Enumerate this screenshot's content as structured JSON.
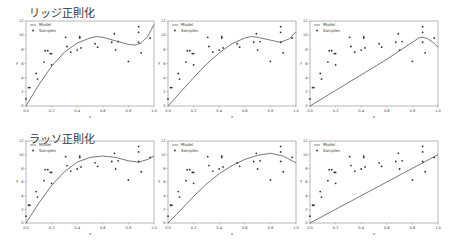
{
  "rows": [
    {
      "title": "リッジ正則化",
      "title_x": 29,
      "title_y": 5
    },
    {
      "title": "ラッソ正則化",
      "title_x": 29,
      "title_y": 131
    }
  ],
  "chart_data": [
    {
      "type": "line",
      "row": 0,
      "col": 0,
      "title": "",
      "xlabel": "x",
      "ylabel": "y",
      "xlim": [
        0,
        1
      ],
      "ylim": [
        0,
        12
      ],
      "legend": [
        "Model",
        "Samples"
      ],
      "model": {
        "x": [
          0,
          0.1,
          0.2,
          0.3,
          0.4,
          0.5,
          0.55,
          0.6,
          0.7,
          0.8,
          0.85,
          0.9,
          0.95,
          1.0
        ],
        "y": [
          0,
          3.0,
          5.6,
          7.6,
          8.9,
          9.6,
          9.8,
          9.7,
          9.2,
          8.7,
          8.6,
          8.9,
          9.8,
          11.5
        ]
      }
    },
    {
      "type": "line",
      "row": 0,
      "col": 1,
      "title": "",
      "xlabel": "x",
      "ylabel": "y",
      "xlim": [
        0,
        1
      ],
      "ylim": [
        0,
        12
      ],
      "legend": [
        "Model",
        "Samples"
      ],
      "model": {
        "x": [
          0,
          0.1,
          0.2,
          0.3,
          0.4,
          0.5,
          0.6,
          0.65,
          0.7,
          0.8,
          0.88,
          0.95,
          1.0
        ],
        "y": [
          0,
          2.0,
          4.0,
          5.9,
          7.5,
          8.8,
          9.6,
          9.8,
          9.7,
          9.3,
          9.0,
          9.5,
          10.5
        ]
      }
    },
    {
      "type": "line",
      "row": 0,
      "col": 2,
      "title": "",
      "xlabel": "x",
      "ylabel": "y",
      "xlim": [
        0,
        1
      ],
      "ylim": [
        0,
        12
      ],
      "legend": [
        "Model",
        "Samples"
      ],
      "model": {
        "x": [
          0,
          0.2,
          0.4,
          0.6,
          0.7,
          0.8,
          0.85,
          0.88,
          0.92,
          0.96,
          1.0
        ],
        "y": [
          0,
          2.2,
          4.4,
          6.6,
          7.8,
          9.0,
          9.6,
          9.7,
          9.5,
          9.0,
          8.3
        ]
      }
    },
    {
      "type": "line",
      "row": 1,
      "col": 0,
      "title": "",
      "xlabel": "x",
      "ylabel": "y",
      "xlim": [
        0,
        1
      ],
      "ylim": [
        0,
        12
      ],
      "legend": [
        "Model",
        "Samples"
      ],
      "model": {
        "x": [
          0,
          0.1,
          0.2,
          0.3,
          0.4,
          0.5,
          0.6,
          0.7,
          0.8,
          0.88,
          0.95,
          1.0
        ],
        "y": [
          0,
          2.9,
          5.5,
          7.5,
          8.9,
          9.6,
          9.8,
          9.6,
          9.1,
          8.9,
          9.3,
          9.8
        ]
      }
    },
    {
      "type": "line",
      "row": 1,
      "col": 1,
      "title": "",
      "xlabel": "x",
      "ylabel": "y",
      "xlim": [
        0,
        1
      ],
      "ylim": [
        0,
        12
      ],
      "legend": [
        "Model",
        "Samples"
      ],
      "model": {
        "x": [
          0,
          0.1,
          0.2,
          0.3,
          0.4,
          0.5,
          0.6,
          0.7,
          0.8,
          0.9,
          1.0
        ],
        "y": [
          0,
          1.9,
          3.9,
          5.7,
          7.2,
          8.4,
          9.3,
          9.9,
          10.2,
          9.8,
          8.8
        ]
      }
    },
    {
      "type": "line",
      "row": 1,
      "col": 2,
      "title": "",
      "xlabel": "x",
      "ylabel": "y",
      "xlim": [
        0,
        1
      ],
      "ylim": [
        0,
        12
      ],
      "legend": [
        "Model",
        "Samples"
      ],
      "model": {
        "x": [
          0,
          1.0
        ],
        "y": [
          0,
          10.0
        ]
      }
    }
  ],
  "samples": {
    "x": [
      0.0,
      0.02,
      0.03,
      0.08,
      0.09,
      0.14,
      0.15,
      0.17,
      0.19,
      0.2,
      0.2,
      0.31,
      0.32,
      0.35,
      0.4,
      0.42,
      0.42,
      0.43,
      0.54,
      0.56,
      0.67,
      0.69,
      0.7,
      0.72,
      0.8,
      0.88,
      0.88,
      0.88,
      0.9,
      0.97
    ],
    "y": [
      1.0,
      2.6,
      2.6,
      4.6,
      3.8,
      6.2,
      7.8,
      7.8,
      7.4,
      7.4,
      5.8,
      9.7,
      8.4,
      7.6,
      7.9,
      9.8,
      9.6,
      8.2,
      8.8,
      8.3,
      9.0,
      10.2,
      7.9,
      9.1,
      6.3,
      11.2,
      10.4,
      9.0,
      7.5,
      9.6
    ]
  },
  "axes": {
    "xticks": [
      "0.0",
      "0.2",
      "0.4",
      "0.6",
      "0.8",
      "1.0"
    ],
    "yticks": [
      "0",
      "2",
      "4",
      "6",
      "8",
      "10",
      "12"
    ],
    "xlabel": "x",
    "ylabel": "y"
  },
  "layout": {
    "col_x": [
      26,
      168,
      310
    ],
    "row_top": [
      21,
      141
    ],
    "row_bottom": [
      106,
      223
    ],
    "width": 128
  },
  "colors": {
    "axis": "#888888",
    "model": "#555555",
    "sample": "#333333",
    "text": "#444444"
  }
}
